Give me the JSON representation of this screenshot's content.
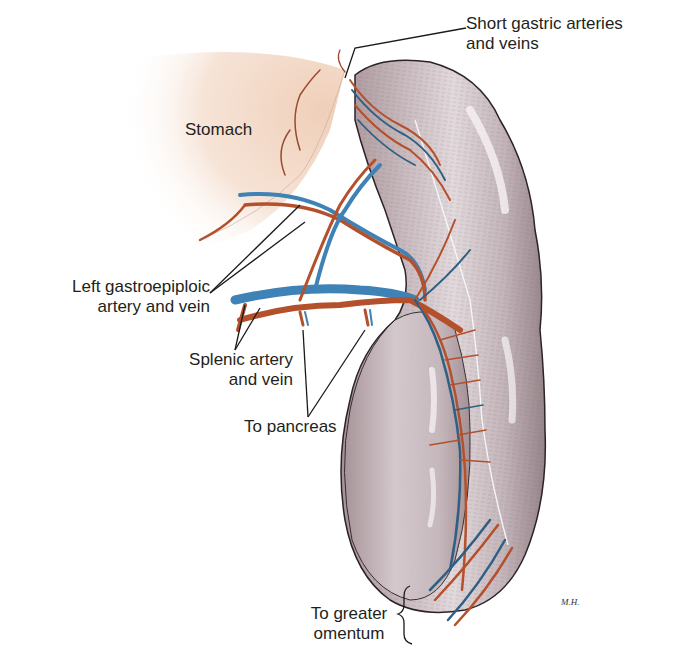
{
  "figure": {
    "colors": {
      "background": "#ffffff",
      "spleen_fill": "#c9bcc0",
      "spleen_shadow": "#8f7f86",
      "spleen_highlight": "#f2eef0",
      "stomach_fill": "#f3d9c8",
      "artery": "#b4502c",
      "vein": "#3f82b5",
      "leader_line": "#1a1a1a",
      "text": "#231f20"
    }
  },
  "labels": {
    "short_gastric": {
      "line1": "Short gastric arteries",
      "line2": "and veins"
    },
    "stomach": {
      "line1": "Stomach"
    },
    "left_gastroepiploic": {
      "line1": "Left gastroepiploic",
      "line2": "artery and vein"
    },
    "splenic": {
      "line1": "Splenic artery",
      "line2": "and vein"
    },
    "to_pancreas": {
      "line1": "To pancreas"
    },
    "to_greater_omentum": {
      "line1": "To greater",
      "line2": "omentum"
    }
  },
  "signature": "M.H."
}
